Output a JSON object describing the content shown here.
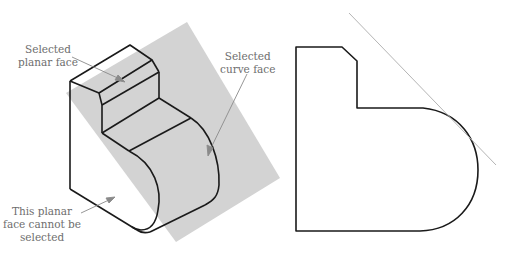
{
  "labels": {
    "selected_planar_face": [
      "Selected",
      "planar face"
    ],
    "selected_curve_face": [
      "Selected",
      "curve face"
    ],
    "cannot_select": [
      "This planar",
      "face cannot be",
      "selected"
    ]
  },
  "colors": {
    "plane_fill": "#d3d3d3",
    "outline": "#1a1a1a",
    "leader": "#8a8a8a",
    "label_text": "#6e6e6e",
    "tangent_line": "#b5b5b5"
  }
}
